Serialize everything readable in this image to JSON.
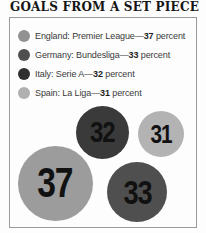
{
  "title": "GOALS FROM A SET PIECE",
  "legend": {
    "items": [
      {
        "label": "England: Premier League—",
        "value": "37",
        "suffix": " percent",
        "color": "#919191"
      },
      {
        "label": "Germany: Bundesliga—",
        "value": "33",
        "suffix": " percent",
        "color": "#4f4f4f"
      },
      {
        "label": "Italy: Serie A—",
        "value": "32",
        "suffix": " percent",
        "color": "#2f2f2f"
      },
      {
        "label": "Spain: La Liga—",
        "value": "31",
        "suffix": " percent",
        "color": "#b0b0b0"
      }
    ]
  },
  "chart_data": {
    "type": "bubble",
    "title": "GOALS FROM A SET PIECE",
    "unit": "percent",
    "categories": [
      "England: Premier League",
      "Germany: Bundesliga",
      "Italy: Serie A",
      "Spain: La Liga"
    ],
    "values": [
      37,
      33,
      32,
      31
    ],
    "legend_position": "top",
    "bubbles": [
      {
        "label": "Italy: Serie A",
        "value": "32",
        "color": "#3a3a3a",
        "cx": 102,
        "cy": 132,
        "d": 53
      },
      {
        "label": "Spain: La Liga",
        "value": "31",
        "color": "#b3b3b3",
        "cx": 161,
        "cy": 134,
        "d": 46
      },
      {
        "label": "England: Premier League",
        "value": "37",
        "color": "#9c9c9c",
        "cx": 55,
        "cy": 183,
        "d": 75
      },
      {
        "label": "Germany: Bundesliga",
        "value": "33",
        "color": "#4f4f4f",
        "cx": 137,
        "cy": 192,
        "d": 60
      }
    ]
  }
}
